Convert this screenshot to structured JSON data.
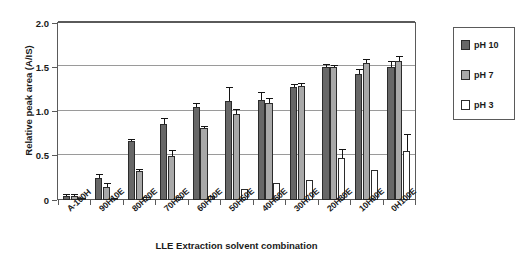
{
  "chart_data": {
    "type": "bar",
    "title": "",
    "xlabel": "LLE Extraction solvent combination",
    "ylabel": "Relative peak area (A/IS)",
    "ylim": [
      0,
      2.0
    ],
    "yticks": [
      "0",
      "0.5",
      "1.0",
      "1.5",
      "2.0"
    ],
    "ytick_values": [
      0,
      0.5,
      1.0,
      1.5,
      2.0
    ],
    "grid": true,
    "legend_position": "right",
    "categories": [
      "A-100H",
      "90H10E",
      "80H20E",
      "70H30E",
      "60H40E",
      "50H50E",
      "40H60E",
      "30H70E",
      "20H80E",
      "10H90E",
      "0H100E"
    ],
    "series": [
      {
        "name": "pH 10",
        "color": "#676767",
        "values": [
          0.05,
          0.25,
          0.67,
          0.86,
          1.05,
          1.12,
          1.13,
          1.28,
          1.5,
          1.42,
          1.5
        ],
        "errors": [
          0.01,
          0.03,
          0.01,
          0.06,
          0.03,
          0.15,
          0.08,
          0.02,
          0.02,
          0.05,
          0.06
        ]
      },
      {
        "name": "pH 7",
        "color": "#a8a8a8",
        "values": [
          0.05,
          0.15,
          0.33,
          0.5,
          0.81,
          0.97,
          1.1,
          1.29,
          1.5,
          1.55,
          1.57
        ],
        "errors": [
          0.01,
          0.03,
          0.01,
          0.05,
          0.01,
          0.05,
          0.04,
          0.02,
          0.01,
          0.03,
          0.05
        ]
      },
      {
        "name": "pH 3",
        "color": "#ffffff",
        "values": [
          0.005,
          0.005,
          0.03,
          0.03,
          0.05,
          0.12,
          0.19,
          0.23,
          0.48,
          0.34,
          0.55
        ],
        "errors": [
          0.0,
          0.0,
          0.0,
          0.0,
          0.0,
          0.0,
          0.0,
          0.0,
          0.09,
          0.0,
          0.18
        ]
      }
    ]
  },
  "legend": {
    "entries": [
      {
        "label": "pH 10"
      },
      {
        "label": "pH 7"
      },
      {
        "label": "pH 3"
      }
    ]
  }
}
